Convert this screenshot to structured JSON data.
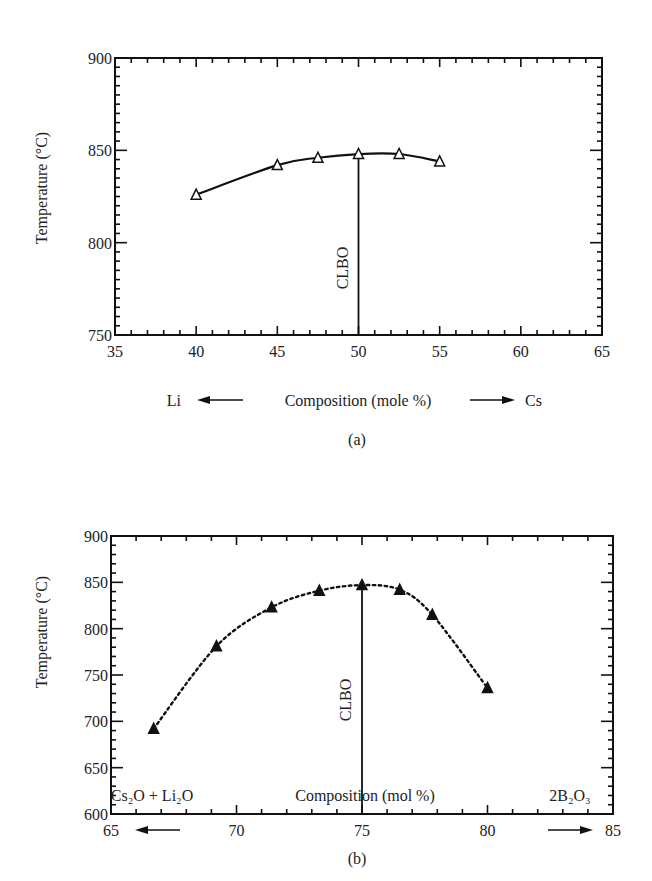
{
  "chart_data": [
    {
      "type": "line",
      "panel": "(a)",
      "xlabel": "Composition (mole %)",
      "xlabel_left": "Li",
      "xlabel_right": "Cs",
      "ylabel": "Temperature (°C)",
      "xlim": [
        35,
        65
      ],
      "ylim": [
        750,
        900
      ],
      "xticks": [
        35,
        40,
        45,
        50,
        55,
        60,
        65
      ],
      "yticks": [
        750,
        800,
        850,
        900
      ],
      "marker": "open-triangle",
      "line_style": "solid",
      "annotation": {
        "text": "CLBO",
        "x": 50
      },
      "series": [
        {
          "name": "melting point",
          "x": [
            40,
            45,
            47.5,
            50,
            52.5,
            55
          ],
          "values": [
            826,
            842,
            846,
            848,
            848,
            844
          ]
        }
      ],
      "grid": false
    },
    {
      "type": "line",
      "panel": "(b)",
      "xlabel": "Composition (mol %)",
      "xlabel_left": "Cs2O + Li2O",
      "xlabel_right": "2B2O3",
      "ylabel": "Temperature (°C)",
      "xlim": [
        65,
        85
      ],
      "ylim": [
        600,
        900
      ],
      "xticks": [
        65,
        70,
        75,
        80,
        85
      ],
      "yticks": [
        600,
        650,
        700,
        750,
        800,
        850,
        900
      ],
      "marker": "filled-triangle",
      "line_style": "dotted",
      "annotation": {
        "text": "CLBO",
        "x": 75
      },
      "series": [
        {
          "name": "melting point",
          "x": [
            66.7,
            69.2,
            71.4,
            73.3,
            75,
            76.5,
            77.8,
            80
          ],
          "values": [
            692,
            781,
            823,
            841,
            847,
            842,
            815,
            736
          ]
        }
      ],
      "grid": false
    }
  ],
  "text": {
    "a_ylabel": "Temperature (°C)",
    "a_xlabel": "Composition (mole %)",
    "a_left": "Li",
    "a_right": "Cs",
    "a_caption": "(a)",
    "a_clbo": "CLBO",
    "b_ylabel": "Temperature (°C)",
    "b_xlabel": "Composition (mol %)",
    "b_left": "Cs₂O + Li₂O",
    "b_right": "2B₂O₃",
    "b_caption": "(b)",
    "b_clbo": "CLBO"
  }
}
